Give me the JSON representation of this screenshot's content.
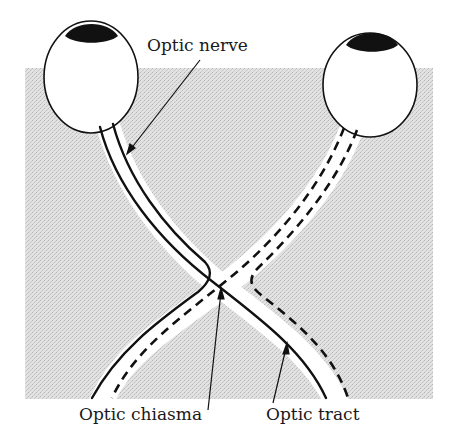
{
  "diagram": {
    "labels": {
      "optic_nerve": "Optic nerve",
      "optic_chiasma": "Optic chiasma",
      "optic_tract": "Optic tract"
    },
    "structures": {
      "left_eye": "left-eyeball",
      "right_eye": "right-eyeball",
      "solid_fibers": "fibers from left eye (solid lines)",
      "dashed_fibers": "fibers from right eye (dashed lines)"
    },
    "colors": {
      "background_shade": "#d9d9d9",
      "ink": "#111111",
      "pupil": "#111111",
      "paper": "#ffffff"
    }
  }
}
